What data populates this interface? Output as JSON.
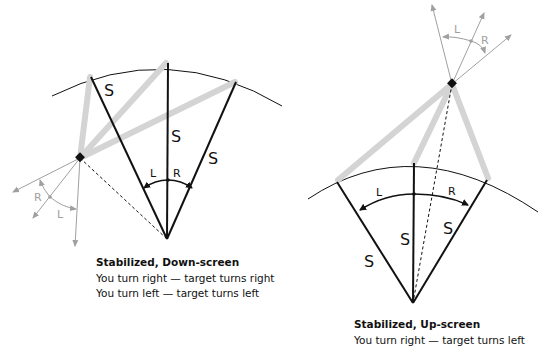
{
  "colors": {
    "black": "#111111",
    "gray": "#a0a0a0",
    "thick_gray": "#d4d4d4"
  },
  "left_diagram": {
    "side_labels": [
      "S",
      "S",
      "S"
    ],
    "arc_labels": {
      "left": "L",
      "right": "R"
    },
    "target_labels": {
      "right": "R",
      "left": "L"
    },
    "caption": {
      "title": "Stabilized,  Down-screen",
      "lines": [
        "You turn right — target turns right",
        "You turn left — target turns left"
      ]
    }
  },
  "right_diagram": {
    "side_labels": [
      "S",
      "S",
      "S"
    ],
    "arc_labels": {
      "left": "L",
      "right": "R"
    },
    "target_labels": {
      "left": "L",
      "right": "R"
    },
    "caption": {
      "title": "Stabilized, Up-screen",
      "lines": [
        "You turn right — target turns left"
      ]
    }
  }
}
